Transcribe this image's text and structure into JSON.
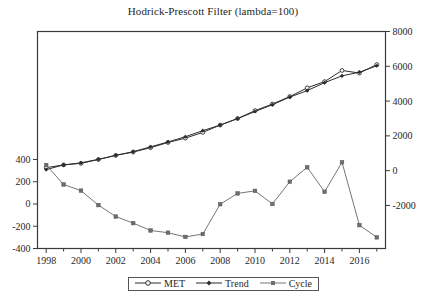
{
  "chart_data": {
    "type": "line",
    "title": "Hodrick-Prescott Filter (lambda=100)",
    "xlabel": "",
    "ylabel": "",
    "grid": false,
    "legend_position": "bottom",
    "x": [
      1998,
      1999,
      2000,
      2001,
      2002,
      2003,
      2004,
      2005,
      2006,
      2007,
      2008,
      2009,
      2010,
      2011,
      2012,
      2013,
      2014,
      2015,
      2016,
      2017
    ],
    "xlim": [
      1997.5,
      2017.5
    ],
    "xticks_major": [
      1998,
      2000,
      2002,
      2004,
      2006,
      2008,
      2010,
      2012,
      2014,
      2016
    ],
    "xticks_minor": [
      1999,
      2001,
      2003,
      2005,
      2007,
      2009,
      2011,
      2013,
      2015,
      2017
    ],
    "xtick_labels": [
      "1998",
      "2000",
      "2002",
      "2004",
      "2006",
      "2008",
      "2010",
      "2012",
      "2014",
      "2016"
    ],
    "left_axis": {
      "name": "Cycle axis",
      "ticks": [
        400,
        200,
        0,
        -200,
        -400
      ],
      "tick_labels": [
        "400",
        "200",
        "0",
        "-200",
        "-400"
      ],
      "ylim": [
        -400,
        1550
      ]
    },
    "right_axis": {
      "name": "MET / Trend axis",
      "ticks": [
        8000,
        6000,
        4000,
        2000,
        0,
        -2000
      ],
      "tick_labels": [
        "8000",
        "6000",
        "4000",
        "2000",
        "0",
        "-2000"
      ],
      "ylim": [
        -4475,
        8000
      ]
    },
    "series": [
      {
        "name": "MET",
        "axis": "right",
        "marker": "open-circle",
        "color": "#2d2d2d",
        "values": [
          170,
          330,
          420,
          640,
          880,
          1070,
          1320,
          1620,
          1870,
          2200,
          2620,
          3000,
          3450,
          3830,
          4260,
          4760,
          5120,
          5760,
          5610,
          6100
        ]
      },
      {
        "name": "Trend",
        "axis": "right",
        "marker": "filled-diamond",
        "color": "#2d2d2d",
        "values": [
          60,
          330,
          450,
          650,
          880,
          1090,
          1370,
          1650,
          1950,
          2300,
          2620,
          2990,
          3400,
          3790,
          4230,
          4600,
          5060,
          5450,
          5660,
          6030
        ]
      },
      {
        "name": "Cycle",
        "axis": "left",
        "marker": "filled-square",
        "color": "#777777",
        "values": [
          350,
          175,
          120,
          -10,
          -113,
          -172,
          -238,
          -258,
          -296,
          -270,
          -2,
          95,
          118,
          0,
          200,
          330,
          110,
          375,
          -190,
          -300
        ]
      }
    ]
  },
  "legend": {
    "items": [
      {
        "label": "MET",
        "marker": "open-circle"
      },
      {
        "label": "Trend",
        "marker": "filled-diamond"
      },
      {
        "label": "Cycle",
        "marker": "filled-square"
      }
    ]
  }
}
